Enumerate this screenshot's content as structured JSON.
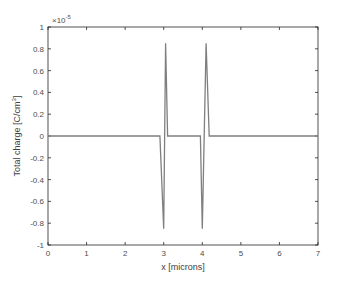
{
  "chart_data": {
    "type": "line",
    "title": "",
    "xlabel": "x [microns]",
    "ylabel": "Total charge [C/cm^3]",
    "ylabel_parts": {
      "main": "Total charge [C/cm",
      "sup": "3",
      "end": "]"
    },
    "y_exponent": "×10",
    "y_exponent_power": "-5",
    "xlim": [
      0,
      7
    ],
    "ylim": [
      -1,
      1
    ],
    "xticks": [
      "0",
      "1",
      "2",
      "3",
      "4",
      "5",
      "6",
      "7"
    ],
    "yticks": [
      "-1",
      "-0.8",
      "-0.6",
      "-0.4",
      "-0.2",
      "0",
      "0.2",
      "0.4",
      "0.6",
      "0.8",
      "1"
    ],
    "grid": false,
    "legend": null,
    "line_color": "#7f7f7f",
    "series": [
      {
        "name": "Total charge",
        "x": [
          0,
          2.9,
          3.0,
          3.05,
          3.1,
          3.95,
          4.0,
          4.1,
          4.18,
          7
        ],
        "y": [
          0,
          0,
          -0.85,
          0.85,
          0,
          0,
          -0.85,
          0.85,
          0,
          0
        ]
      }
    ]
  }
}
